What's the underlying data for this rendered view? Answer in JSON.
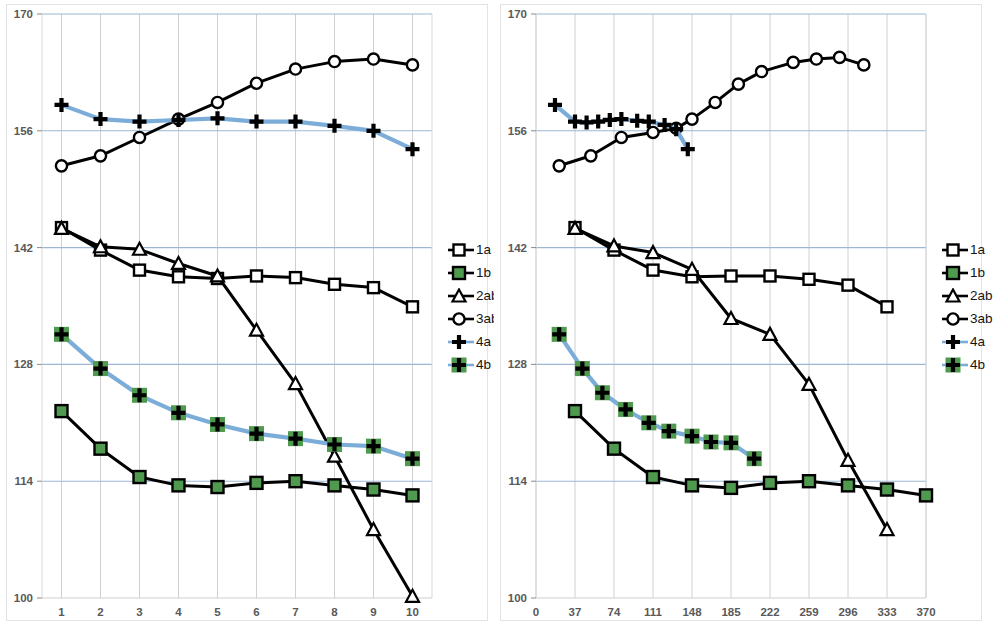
{
  "figure": {
    "panels": [
      "left",
      "right"
    ],
    "legend_position": "right-middle",
    "axis_label_color": "#595959",
    "gridline_color_horizontal": "#9bb7d4",
    "gridline_color_vertical": "#d0d0d0",
    "plot_border_color": "#d9d9d9"
  },
  "series_style": {
    "1a": {
      "marker": "square-open",
      "line_color": "#000000",
      "marker_fill": "#ffffff",
      "marker_edge": "#000000"
    },
    "1b": {
      "marker": "square-filled",
      "line_color": "#000000",
      "marker_fill": "#4f9a4f",
      "marker_edge": "#000000"
    },
    "2ab": {
      "marker": "triangle-open",
      "line_color": "#000000",
      "marker_fill": "#ffffff",
      "marker_edge": "#000000"
    },
    "3ab": {
      "marker": "circle-open",
      "line_color": "#000000",
      "marker_fill": "#ffffff",
      "marker_edge": "#000000"
    },
    "4a": {
      "marker": "plus",
      "line_color": "#7cadd9",
      "marker_fill": "#000000",
      "marker_edge": "#000000"
    },
    "4b": {
      "marker": "plus-on-green",
      "line_color": "#7cadd9",
      "marker_fill": "#4f9a4f",
      "marker_edge": "#000000"
    }
  },
  "legend": {
    "entries": [
      {
        "key": "1a",
        "label": "1a"
      },
      {
        "key": "1b",
        "label": "1b"
      },
      {
        "key": "2ab",
        "label": "2ab"
      },
      {
        "key": "3ab",
        "label": "3ab"
      },
      {
        "key": "4a",
        "label": "4a"
      },
      {
        "key": "4b",
        "label": "4b"
      }
    ]
  },
  "chart_data": [
    {
      "type": "line",
      "panel": "left",
      "title": "",
      "xlabel": "",
      "ylabel": "",
      "grid": true,
      "legend": [
        "1a",
        "1b",
        "2ab",
        "3ab",
        "4a",
        "4b"
      ],
      "categories": [
        1,
        2,
        3,
        4,
        5,
        6,
        7,
        8,
        9,
        10
      ],
      "xtick_labels": [
        "1",
        "2",
        "3",
        "4",
        "5",
        "6",
        "7",
        "8",
        "9",
        "10"
      ],
      "ytick_labels": [
        "100",
        "114",
        "128",
        "142",
        "156",
        "170"
      ],
      "yticks": [
        100,
        114,
        128,
        142,
        156,
        170
      ],
      "ylim": [
        100,
        170
      ],
      "xlim": [
        0.5,
        10.5
      ],
      "series": [
        {
          "name": "1a",
          "x": [
            1,
            2,
            3,
            4,
            5,
            6,
            7,
            8,
            9,
            10
          ],
          "values": [
            144.4,
            141.7,
            139.3,
            138.5,
            138.3,
            138.6,
            138.4,
            137.6,
            137.2,
            134.9
          ]
        },
        {
          "name": "1b",
          "x": [
            1,
            2,
            3,
            4,
            5,
            6,
            7,
            8,
            9,
            10
          ],
          "values": [
            122.4,
            117.9,
            114.5,
            113.5,
            113.3,
            113.8,
            114.0,
            113.5,
            113.0,
            112.3
          ]
        },
        {
          "name": "2ab",
          "x": [
            1,
            2,
            3,
            4,
            5,
            6,
            7,
            8,
            9,
            10
          ],
          "values": [
            144.3,
            142.1,
            141.8,
            140.1,
            138.6,
            132.1,
            125.7,
            117.0,
            108.2,
            100.2
          ]
        },
        {
          "name": "3ab",
          "x": [
            1,
            2,
            3,
            4,
            5,
            6,
            7,
            8,
            9,
            10
          ],
          "values": [
            151.8,
            153.0,
            155.2,
            157.4,
            159.4,
            161.7,
            163.4,
            164.3,
            164.6,
            163.9
          ]
        },
        {
          "name": "4a",
          "x": [
            1,
            2,
            3,
            4,
            5,
            6,
            7,
            8,
            9,
            10
          ],
          "values": [
            159.1,
            157.4,
            157.1,
            157.3,
            157.5,
            157.1,
            157.1,
            156.6,
            156.0,
            153.8
          ]
        },
        {
          "name": "4b",
          "x": [
            1,
            2,
            3,
            4,
            5,
            6,
            7,
            8,
            9,
            10
          ],
          "values": [
            131.6,
            127.5,
            124.3,
            122.2,
            120.8,
            119.7,
            119.1,
            118.4,
            118.2,
            116.7
          ]
        }
      ]
    },
    {
      "type": "line",
      "panel": "right",
      "title": "",
      "xlabel": "",
      "ylabel": "",
      "grid": true,
      "legend": [
        "1a",
        "1b",
        "2ab",
        "3ab",
        "4a",
        "4b"
      ],
      "xtick_labels": [
        "0",
        "37",
        "74",
        "111",
        "148",
        "185",
        "222",
        "259",
        "296",
        "333",
        "370"
      ],
      "xticks": [
        0,
        37,
        74,
        111,
        148,
        185,
        222,
        259,
        296,
        333,
        370
      ],
      "ytick_labels": [
        "100",
        "114",
        "128",
        "142",
        "156",
        "170"
      ],
      "yticks": [
        100,
        114,
        128,
        142,
        156,
        170
      ],
      "ylim": [
        100,
        170
      ],
      "xlim": [
        0,
        370
      ],
      "series": [
        {
          "name": "1a",
          "x": [
            37,
            74,
            111,
            148,
            185,
            222,
            259,
            296,
            333
          ],
          "values": [
            144.4,
            141.7,
            139.3,
            138.5,
            138.6,
            138.6,
            138.2,
            137.5,
            134.9
          ]
        },
        {
          "name": "1b",
          "x": [
            37,
            74,
            111,
            148,
            185,
            222,
            259,
            296,
            333,
            370
          ],
          "values": [
            122.4,
            117.9,
            114.5,
            113.5,
            113.2,
            113.8,
            114.0,
            113.5,
            113.0,
            112.3
          ]
        },
        {
          "name": "2ab",
          "x": [
            37,
            74,
            111,
            148,
            185,
            222,
            259,
            296,
            333
          ],
          "values": [
            144.3,
            142.2,
            141.4,
            139.4,
            133.5,
            131.6,
            125.6,
            116.5,
            108.2
          ]
        },
        {
          "name": "3ab",
          "x": [
            22,
            52,
            81,
            111,
            133,
            148,
            170,
            192,
            214,
            244,
            266,
            288,
            311
          ],
          "values": [
            151.8,
            153.0,
            155.2,
            155.8,
            156.3,
            157.4,
            159.4,
            161.6,
            163.1,
            164.2,
            164.6,
            164.8,
            163.9
          ]
        },
        {
          "name": "4a",
          "x": [
            18,
            37,
            48,
            59,
            70,
            81,
            96,
            107,
            122,
            133,
            144
          ],
          "values": [
            159.1,
            157.1,
            157.0,
            157.1,
            157.3,
            157.4,
            157.2,
            157.1,
            156.7,
            156.2,
            153.8
          ]
        },
        {
          "name": "4b",
          "x": [
            22,
            44,
            63,
            85,
            107,
            126,
            148,
            166,
            185,
            207
          ],
          "values": [
            131.6,
            127.5,
            124.6,
            122.6,
            121.0,
            120.0,
            119.4,
            118.7,
            118.6,
            116.7
          ]
        }
      ]
    }
  ]
}
